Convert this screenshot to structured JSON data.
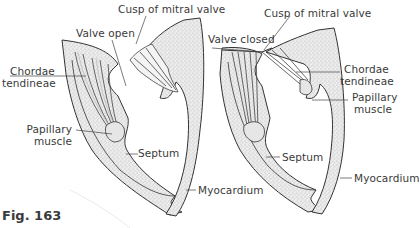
{
  "figure": {
    "caption": "Fig. 163",
    "panels": [
      {
        "state": "open",
        "labels": {
          "cusp": "Cusp of mitral valve",
          "valve_state": "Valve open",
          "chordae_line1": "Chordae",
          "chordae_line2": "tendineae",
          "papillary_line1": "Papillary",
          "papillary_line2": "muscle",
          "septum": "Septum",
          "myocardium": "Myocardium"
        }
      },
      {
        "state": "closed",
        "labels": {
          "cusp": "Cusp of mitral valve",
          "valve_state": "Valve closed",
          "chordae_line1": "Chordae",
          "chordae_line2": "tendineae",
          "papillary_line1": "Papillary",
          "papillary_line2": "muscle",
          "septum": "Septum",
          "myocardium": "Myocardium"
        }
      }
    ],
    "colors": {
      "ink": "#3a3a3a",
      "tissue_fill": "#dcdcdc",
      "background": "#ffffff"
    }
  }
}
